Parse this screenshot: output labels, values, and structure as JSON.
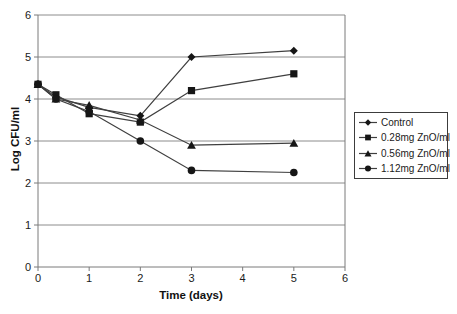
{
  "chart_data": {
    "type": "line",
    "title": "",
    "xlabel": "Time (days)",
    "ylabel": "Log CFU/ml",
    "xlim": [
      0,
      6
    ],
    "ylim": [
      0,
      6
    ],
    "x_ticks": [
      0,
      1,
      2,
      3,
      4,
      5,
      6
    ],
    "y_ticks": [
      0,
      1,
      2,
      3,
      4,
      5,
      6
    ],
    "grid": "horizontal gridlines at every integer y value",
    "legend_position": "right, boxed",
    "x": [
      0,
      0.35,
      1,
      2,
      3,
      5
    ],
    "series": [
      {
        "name": "Control",
        "marker": "diamond",
        "values": [
          4.35,
          4.05,
          3.8,
          3.6,
          5.0,
          5.15
        ]
      },
      {
        "name": "0.28mg ZnO/ml",
        "marker": "square",
        "values": [
          4.35,
          4.1,
          3.65,
          3.45,
          4.2,
          4.6
        ]
      },
      {
        "name": "0.56mg ZnO/ml",
        "marker": "triangle",
        "values": [
          4.35,
          4.0,
          3.85,
          3.5,
          2.9,
          2.95
        ]
      },
      {
        "name": "1.12mg ZnO/ml",
        "marker": "circle",
        "values": [
          4.35,
          4.0,
          3.7,
          3.0,
          2.3,
          2.25
        ]
      }
    ],
    "colors": {
      "series_line": "#3f3f3f",
      "marker_fill": "#161616",
      "gridline": "#8c8c8c",
      "axis": "#7a7a7a",
      "text": "#1a1a1a",
      "legend_border": "#3c3c3c"
    }
  }
}
